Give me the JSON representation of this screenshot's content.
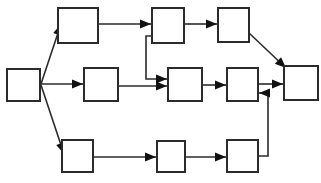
{
  "diagram": {
    "type": "node-link-diagram",
    "canvas": {
      "width": 321,
      "height": 183
    },
    "style": {
      "background_color": "#ffffff",
      "node_fill": "#ffffff",
      "node_stroke": "#2b2b2b",
      "edge_color": "#2b2b2b",
      "arrow_color": "#111111",
      "node_stroke_width": 2,
      "edge_stroke_width": 1.6
    },
    "nodes": [
      {
        "id": "start",
        "label": "",
        "x": 7,
        "y": 69,
        "w": 33,
        "h": 32,
        "row": "middle",
        "order": 0
      },
      {
        "id": "t1",
        "label": "",
        "x": 58,
        "y": 8,
        "w": 40,
        "h": 35,
        "row": "top",
        "order": 1
      },
      {
        "id": "t2",
        "label": "",
        "x": 152,
        "y": 8,
        "w": 32,
        "h": 35,
        "row": "top",
        "order": 2
      },
      {
        "id": "t3",
        "label": "",
        "x": 218,
        "y": 8,
        "w": 31,
        "h": 34,
        "row": "top",
        "order": 3
      },
      {
        "id": "m1",
        "label": "",
        "x": 84,
        "y": 68,
        "w": 34,
        "h": 33,
        "row": "middle",
        "order": 1
      },
      {
        "id": "m2",
        "label": "",
        "x": 168,
        "y": 68,
        "w": 34,
        "h": 33,
        "row": "middle",
        "order": 2
      },
      {
        "id": "m3",
        "label": "",
        "x": 227,
        "y": 68,
        "w": 31,
        "h": 33,
        "row": "middle",
        "order": 3
      },
      {
        "id": "end",
        "label": "",
        "x": 284,
        "y": 66,
        "w": 34,
        "h": 34,
        "row": "middle",
        "order": 4
      },
      {
        "id": "b1",
        "label": "",
        "x": 62,
        "y": 140,
        "w": 31,
        "h": 32,
        "row": "bottom",
        "order": 1
      },
      {
        "id": "b2",
        "label": "",
        "x": 157,
        "y": 141,
        "w": 28,
        "h": 31,
        "row": "bottom",
        "order": 2
      },
      {
        "id": "b3",
        "label": "",
        "x": 227,
        "y": 140,
        "w": 31,
        "h": 32,
        "row": "bottom",
        "order": 3
      }
    ],
    "edges": [
      {
        "id": "e-start-t1",
        "from": "start",
        "to": "t1",
        "shape": "diagonal",
        "path": "M 41 84 L 61 24",
        "arrow_at": [
          61,
          24
        ],
        "arrow_angle": -72
      },
      {
        "id": "e-start-m1",
        "from": "start",
        "to": "m1",
        "shape": "horizontal",
        "path": "M 41 84 L 83 84",
        "arrow_at": [
          83,
          84
        ],
        "arrow_angle": 0
      },
      {
        "id": "e-start-b1",
        "from": "start",
        "to": "b1",
        "shape": "diagonal",
        "path": "M 41 85 L 64 154",
        "arrow_at": [
          64,
          154
        ],
        "arrow_angle": 72
      },
      {
        "id": "e-t1-t2",
        "from": "t1",
        "to": "t2",
        "shape": "horizontal",
        "path": "M 99 24 L 151 24",
        "arrow_at": [
          151,
          24
        ],
        "arrow_angle": 0
      },
      {
        "id": "e-t2-t3",
        "from": "t2",
        "to": "t3",
        "shape": "horizontal",
        "path": "M 185 24 L 217 24",
        "arrow_at": [
          217,
          24
        ],
        "arrow_angle": 0
      },
      {
        "id": "e-t2-m2",
        "from": "t2",
        "to": "m2",
        "shape": "orthogonal",
        "path": "M 152 36 L 146 36 L 146 79 L 167 79",
        "arrow_at": [
          167,
          79
        ],
        "arrow_angle": 0
      },
      {
        "id": "e-t3-end",
        "from": "t3",
        "to": "end",
        "shape": "diagonal",
        "path": "M 249 33 L 286 68",
        "arrow_at": [
          286,
          68
        ],
        "arrow_angle": 43
      },
      {
        "id": "e-m1-m2",
        "from": "m1",
        "to": "m2",
        "shape": "horizontal",
        "path": "M 119 86 L 167 86",
        "arrow_at": [
          167,
          86
        ],
        "arrow_angle": 0
      },
      {
        "id": "e-m2-m3",
        "from": "m2",
        "to": "m3",
        "shape": "horizontal",
        "path": "M 203 85 L 226 85",
        "arrow_at": [
          226,
          85
        ],
        "arrow_angle": 0
      },
      {
        "id": "e-m3-end",
        "from": "m3",
        "to": "end",
        "shape": "horizontal",
        "path": "M 259 84 L 283 84",
        "arrow_at": [
          283,
          84
        ],
        "arrow_angle": 0
      },
      {
        "id": "e-b1-b2",
        "from": "b1",
        "to": "b2",
        "shape": "horizontal",
        "path": "M 94 157 L 156 157",
        "arrow_at": [
          156,
          157
        ],
        "arrow_angle": 0
      },
      {
        "id": "e-b2-b3",
        "from": "b2",
        "to": "b3",
        "shape": "horizontal",
        "path": "M 186 157 L 226 157",
        "arrow_at": [
          226,
          157
        ],
        "arrow_angle": 0
      },
      {
        "id": "e-b3-m3",
        "from": "b3",
        "to": "m3",
        "shape": "orthogonal",
        "path": "M 259 156 L 268 156 L 268 93 L 259 93",
        "arrow_at": [
          259,
          93
        ],
        "arrow_angle": 180
      }
    ]
  }
}
